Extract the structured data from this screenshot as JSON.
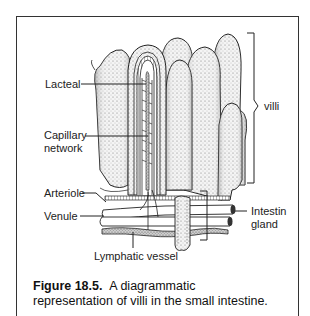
{
  "figure": {
    "number": "Figure 18.5.",
    "caption_line1": "A diagrammatic",
    "caption_line2": "representation of villi in the small intestine."
  },
  "labels": {
    "lacteal": "Lacteal",
    "capillary_line1": "Capillary",
    "capillary_line2": "network",
    "arteriole": "Arteriole",
    "venule": "Venule",
    "lymphatic_vessel": "Lymphatic vessel",
    "villi": "villi",
    "intestinal_gland_line1": "Intestin",
    "intestinal_gland_line2": "gland"
  },
  "colors": {
    "ink": "#222222",
    "stipple": "#8a8a8a",
    "border": "#333333",
    "background": "#ffffff"
  }
}
